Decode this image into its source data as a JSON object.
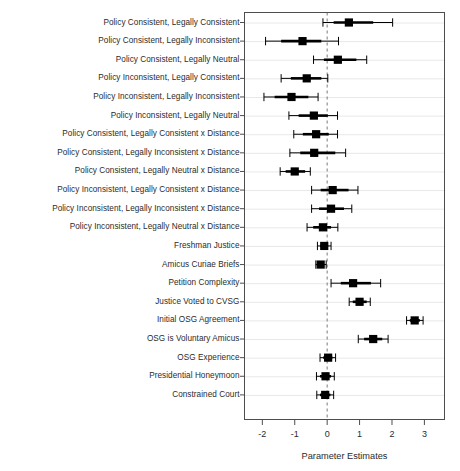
{
  "chart_data": {
    "type": "scatter",
    "subtype": "coefficient-plot",
    "title": "",
    "xlabel": "Parameter Estimates",
    "ylabel": "",
    "xlim": [
      -2.55,
      3.62
    ],
    "xticks": [
      -2,
      -1,
      0,
      1,
      2,
      3
    ],
    "xticklabels": [
      "-2",
      "-1",
      "0",
      "1",
      "2",
      "3"
    ],
    "grid": "horizontal-per-row",
    "reference_line": {
      "x": 0,
      "style": "dashed"
    },
    "legend": "none",
    "marker": "filled-square",
    "intervals": [
      "inner-thick-90",
      "outer-thin-95"
    ],
    "categories": [
      "Policy Consistent, Legally Consistent",
      "Policy Consistent, Legally Inconsistent",
      "Policy Consistent, Legally Neutral",
      "Policy Inconsistent, Legally Consistent",
      "Policy Inconsistent, Legally Inconsistent",
      "Policy Inconsistent, Legally Neutral",
      "Policy Consistent, Legally Consistent x Distance",
      "Policy Consistent, Legally Inconsistent x Distance",
      "Policy Consistent, Legally Neutral x Distance",
      "Policy Inconsistent, Legally Consistent x Distance",
      "Policy Inconsistent, Legally Inconsistent x Distance",
      "Policy Inconsistent, Legally Neutral x Distance",
      "Freshman Justice",
      "Amicus Curiae Briefs",
      "Petition Complexity",
      "Justice Voted to CVSG",
      "Initial OSG Agreement",
      "OSG is Voluntary Amicus",
      "OSG Experience",
      "Presidential Honeymoon",
      "Constrained Court"
    ],
    "estimates": [
      0.67,
      -0.76,
      0.33,
      -0.63,
      -1.1,
      -0.41,
      -0.34,
      -0.4,
      -1.0,
      0.17,
      0.12,
      -0.13,
      -0.09,
      -0.2,
      0.8,
      1.0,
      2.7,
      1.42,
      0.03,
      -0.05,
      -0.06
    ],
    "ci90_low": [
      0.2,
      -1.42,
      -0.1,
      -1.12,
      -1.62,
      -0.88,
      -0.75,
      -0.83,
      -1.28,
      -0.2,
      -0.25,
      -0.43,
      -0.22,
      -0.3,
      0.42,
      0.79,
      2.55,
      1.14,
      -0.12,
      -0.22,
      -0.22
    ],
    "ci90_high": [
      1.42,
      -0.18,
      0.9,
      -0.18,
      -0.58,
      0.02,
      0.05,
      0.25,
      -0.68,
      0.66,
      0.52,
      0.12,
      0.03,
      -0.1,
      1.35,
      1.22,
      2.86,
      1.7,
      0.16,
      0.12,
      0.1
    ],
    "ci95_low": [
      -0.13,
      -1.9,
      -0.42,
      -1.42,
      -1.95,
      -1.18,
      -1.03,
      -1.15,
      -1.45,
      -0.48,
      -0.48,
      -0.62,
      -0.3,
      -0.35,
      0.12,
      0.68,
      2.45,
      0.96,
      -0.22,
      -0.33,
      -0.32
    ],
    "ci95_high": [
      2.02,
      0.35,
      1.22,
      0.02,
      -0.28,
      0.32,
      0.32,
      0.57,
      -0.52,
      0.95,
      0.76,
      0.33,
      0.12,
      -0.03,
      1.65,
      1.33,
      2.96,
      1.88,
      0.26,
      0.22,
      0.2
    ]
  },
  "colors": {
    "marker": "#000000",
    "frame": "#4d4d4d",
    "grid": "#e8e8e8",
    "zero_line": "#7a7a7a",
    "text": "#2b2b2b",
    "background": "#ffffff"
  }
}
